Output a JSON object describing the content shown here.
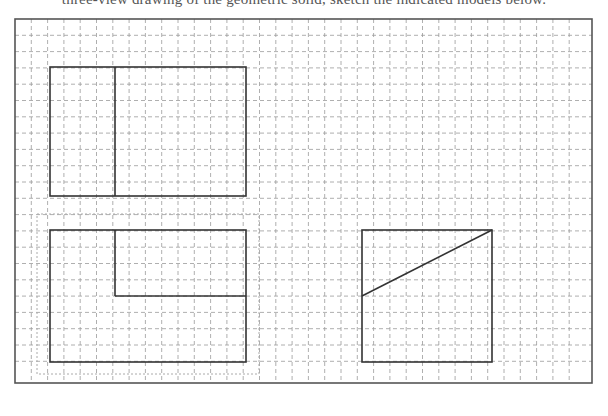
{
  "caption": {
    "text": "three-view drawing of the geometric solid, sketch the indicated models below."
  },
  "figure": {
    "frame": {
      "x": 15,
      "y": 19,
      "width": 577,
      "height": 364
    },
    "grid": {
      "pitch": 16.3,
      "origin_x": 15,
      "origin_y": 19,
      "cols": 35,
      "rows": 22,
      "style": "dashed",
      "color": "#9a9a9a"
    },
    "views": [
      {
        "name": "front-view",
        "rect": {
          "x": 50,
          "y": 67,
          "width": 196,
          "height": 129
        },
        "lines": [
          {
            "x1": 115,
            "y1": 67,
            "x2": 115,
            "y2": 196
          }
        ]
      },
      {
        "name": "top-view",
        "rect": {
          "x": 50,
          "y": 230,
          "width": 196,
          "height": 132
        },
        "outline_dotted": {
          "x": 37,
          "y": 214,
          "width": 222,
          "height": 160
        },
        "lines": [
          {
            "x1": 115,
            "y1": 230,
            "x2": 115,
            "y2": 296
          },
          {
            "x1": 115,
            "y1": 296,
            "x2": 246,
            "y2": 296
          }
        ]
      },
      {
        "name": "side-view",
        "rect": {
          "x": 362,
          "y": 230,
          "width": 130,
          "height": 132
        },
        "lines": [
          {
            "x1": 362,
            "y1": 296,
            "x2": 492,
            "y2": 230
          }
        ]
      }
    ],
    "colors": {
      "stroke": "#333333",
      "grid": "#9a9a9a",
      "frame": "#555555"
    }
  }
}
